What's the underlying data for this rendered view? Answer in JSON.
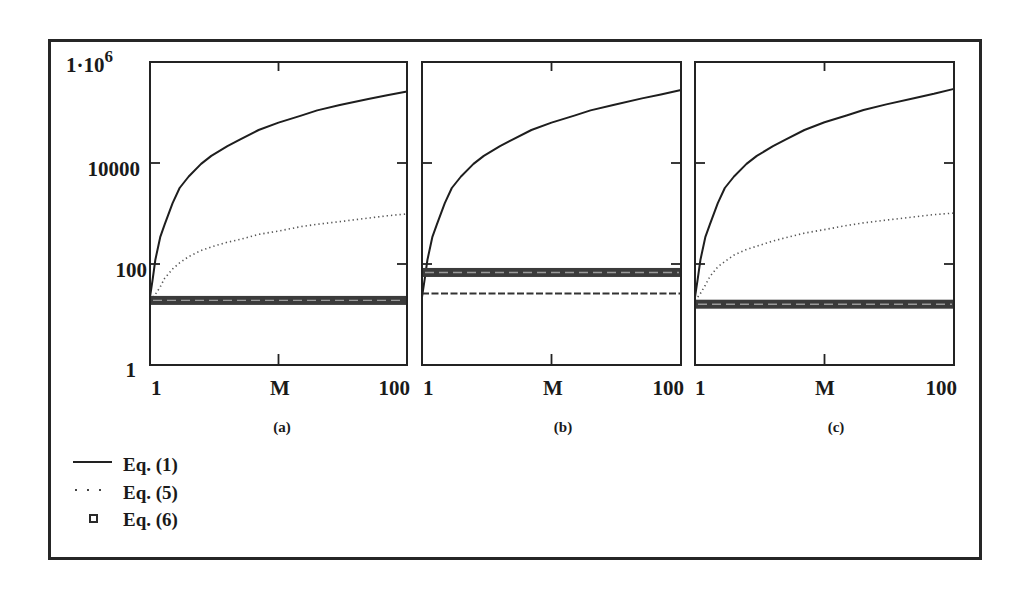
{
  "figure": {
    "y_axis_labels": {
      "top_base": "1·10",
      "top_exp": "6",
      "t10000": "10000",
      "t100": "100",
      "t1": "1"
    },
    "panels": [
      {
        "caption": "(a)",
        "x_tick_left": "1",
        "x_label": "M",
        "x_tick_right": "100"
      },
      {
        "caption": "(b)",
        "x_tick_left": "1",
        "x_label": "M",
        "x_tick_right": "100"
      },
      {
        "caption": "(c)",
        "x_tick_left": "1",
        "x_label": "M",
        "x_tick_right": "100"
      }
    ],
    "legend": [
      {
        "label": "Eq. (1)",
        "marker": "solid-line"
      },
      {
        "label": "Eq. (5)",
        "marker": "dotted-line"
      },
      {
        "label": "Eq. (6)",
        "marker": "open-square"
      }
    ],
    "colors": {
      "ink": "#1e1e1e",
      "dotted": "#555555",
      "band": "#3b3b3b",
      "band_texture": "#9a9a9a"
    }
  },
  "chart_data": [
    {
      "type": "line",
      "title": "(a)",
      "xlabel": "M",
      "ylabel": "",
      "xscale": "log",
      "yscale": "log",
      "xlim": [
        1,
        100
      ],
      "ylim": [
        1,
        1000000
      ],
      "xtick_labels": [
        "1",
        "100"
      ],
      "ytick_labels": [
        "1",
        "100",
        "10000",
        "1·10^6"
      ],
      "grid": false,
      "legend_position": "bottom-left (shared)",
      "x": [
        1,
        1.05,
        1.1,
        1.2,
        1.3,
        1.5,
        1.7,
        2,
        2.5,
        3,
        4,
        5,
        7,
        10,
        15,
        20,
        30,
        50,
        70,
        100
      ],
      "series": [
        {
          "name": "Eq. (1)",
          "style": "solid",
          "values": [
            22,
            50,
            120,
            340,
            600,
            1600,
            3200,
            5400,
            9600,
            13800,
            21500,
            29000,
            45000,
            63000,
            87000,
            110000,
            141000,
            186000,
            219000,
            260000
          ]
        },
        {
          "name": "Eq. (5)",
          "style": "dotted",
          "values": [
            19,
            22,
            25,
            35,
            52,
            80,
            105,
            140,
            185,
            218,
            270,
            305,
            385,
            450,
            550,
            610,
            690,
            810,
            900,
            980
          ]
        },
        {
          "name": "Eq. (6)",
          "style": "square-markers",
          "values": [
            19,
            19,
            19,
            19,
            19,
            19,
            19,
            19,
            19,
            19,
            19,
            19,
            19,
            19,
            19,
            19,
            19,
            19,
            19,
            19
          ]
        }
      ]
    },
    {
      "type": "line",
      "title": "(b)",
      "xlabel": "M",
      "ylabel": "",
      "xscale": "log",
      "yscale": "log",
      "xlim": [
        1,
        100
      ],
      "ylim": [
        1,
        1000000
      ],
      "xtick_labels": [
        "1",
        "100"
      ],
      "ytick_labels": [
        "1",
        "100",
        "10000",
        "1·10^6"
      ],
      "grid": false,
      "legend_position": "bottom-left (shared)",
      "x": [
        1,
        1.05,
        1.1,
        1.2,
        1.3,
        1.5,
        1.7,
        2,
        2.5,
        3,
        4,
        5,
        7,
        10,
        15,
        20,
        30,
        50,
        70,
        100
      ],
      "series": [
        {
          "name": "Eq. (1)",
          "style": "solid",
          "values": [
            22,
            50,
            120,
            340,
            600,
            1600,
            3200,
            5400,
            9600,
            13800,
            21500,
            29000,
            45000,
            63000,
            87000,
            110000,
            141000,
            190000,
            228000,
            280000
          ]
        },
        {
          "name": "Eq. (5)",
          "style": "dashed",
          "values": [
            26,
            26,
            26,
            26,
            26,
            26,
            26,
            26,
            26,
            26,
            26,
            26,
            26,
            26,
            26,
            26,
            26,
            26,
            26,
            26
          ]
        },
        {
          "name": "Eq. (6)",
          "style": "square-markers",
          "values": [
            68,
            68,
            68,
            68,
            68,
            68,
            68,
            68,
            68,
            68,
            68,
            68,
            68,
            68,
            68,
            68,
            68,
            68,
            68,
            68
          ]
        }
      ]
    },
    {
      "type": "line",
      "title": "(c)",
      "xlabel": "M",
      "ylabel": "",
      "xscale": "log",
      "yscale": "log",
      "xlim": [
        1,
        100
      ],
      "ylim": [
        1,
        1000000
      ],
      "xtick_labels": [
        "1",
        "100"
      ],
      "ytick_labels": [
        "1",
        "100",
        "10000",
        "1·10^6"
      ],
      "grid": false,
      "legend_position": "bottom-left (shared)",
      "x": [
        1,
        1.05,
        1.1,
        1.2,
        1.3,
        1.5,
        1.7,
        2,
        2.5,
        3,
        4,
        5,
        7,
        10,
        15,
        20,
        30,
        50,
        70,
        100
      ],
      "series": [
        {
          "name": "Eq. (1)",
          "style": "solid",
          "values": [
            22,
            50,
            120,
            340,
            600,
            1600,
            3200,
            5400,
            9600,
            13800,
            21500,
            29000,
            45000,
            64000,
            88000,
            112000,
            145000,
            195000,
            235000,
            293000
          ]
        },
        {
          "name": "Eq. (5)",
          "style": "dotted",
          "values": [
            19,
            22,
            26,
            38,
            56,
            88,
            112,
            150,
            195,
            225,
            285,
            330,
            410,
            480,
            580,
            650,
            740,
            860,
            950,
            1020
          ]
        },
        {
          "name": "Eq. (6)",
          "style": "square-markers",
          "values": [
            16,
            16,
            16,
            16,
            16,
            16,
            16,
            16,
            16,
            16,
            16,
            16,
            16,
            16,
            16,
            16,
            16,
            16,
            16,
            16
          ]
        }
      ]
    }
  ]
}
